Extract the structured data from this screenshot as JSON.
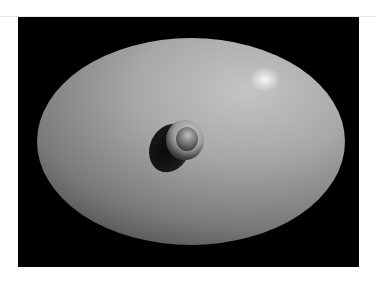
{
  "image": {
    "description": "Grayscale rendered ellipsoidal surface with a central bump/dimple on a black background",
    "subject": "smooth elliptical dome with central protrusion",
    "colors": {
      "background": "#000000",
      "page": "#ffffff",
      "surface_highlight": "#e0e0e0",
      "surface_mid": "#9a9a9a",
      "surface_shadow": "#1a1a1a"
    }
  }
}
